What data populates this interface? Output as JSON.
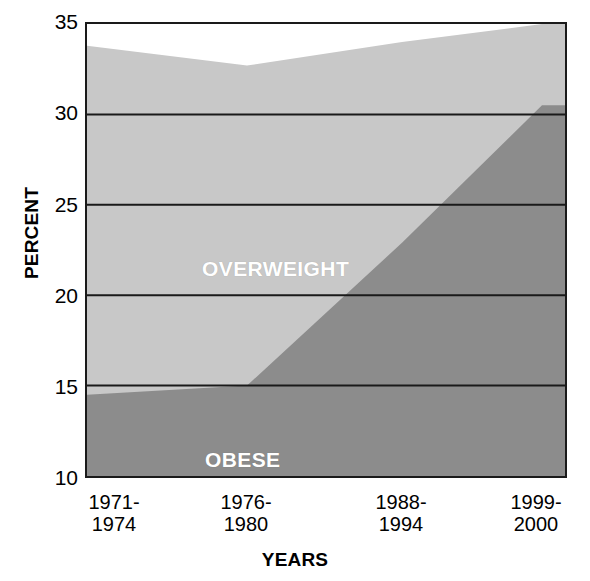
{
  "chart_data": {
    "type": "area",
    "title": "",
    "subtitle": "",
    "xlabel": "YEARS",
    "ylabel": "PERCENT",
    "categories": [
      "1971-1974",
      "1976-1980",
      "1988-1994",
      "1999-2000"
    ],
    "x_tick_labels": [
      {
        "line1": "1971-",
        "line2": "1974"
      },
      {
        "line1": "1976-",
        "line2": "1980"
      },
      {
        "line1": "1988-",
        "line2": "1994"
      },
      {
        "line1": "1999-",
        "line2": "2000"
      }
    ],
    "y_tick_labels": [
      "35",
      "30",
      "25",
      "20",
      "15",
      "10"
    ],
    "y_ticks": [
      35,
      30,
      25,
      20,
      15,
      10
    ],
    "ylim": [
      10,
      35
    ],
    "xlim": [
      0,
      3
    ],
    "grid": "horizontal",
    "legend": "inline-labels",
    "stacked": true,
    "series": [
      {
        "name": "OBESE",
        "values": [
          14.5,
          15.0,
          22.9,
          30.5
        ],
        "color": "#8c8c8c",
        "label_color": "#ffffff"
      },
      {
        "name": "OVERWEIGHT",
        "values": [
          19.3,
          17.7,
          11.1,
          4.5
        ],
        "cumulative_top": [
          33.8,
          32.7,
          34.0,
          35.0
        ],
        "color": "#c8c8c8",
        "label_color": "#ffffff"
      }
    ],
    "annotations": [
      {
        "text": "OVERWEIGHT",
        "series": "OVERWEIGHT"
      },
      {
        "text": "OBESE",
        "series": "OBESE"
      }
    ],
    "colors": {
      "overweight_fill": "#c8c8c8",
      "obese_fill": "#8c8c8c",
      "gridline": "#1a1a1a",
      "axis_border": "#1a1a1a",
      "background": "#ffffff",
      "text": "#000000"
    }
  }
}
